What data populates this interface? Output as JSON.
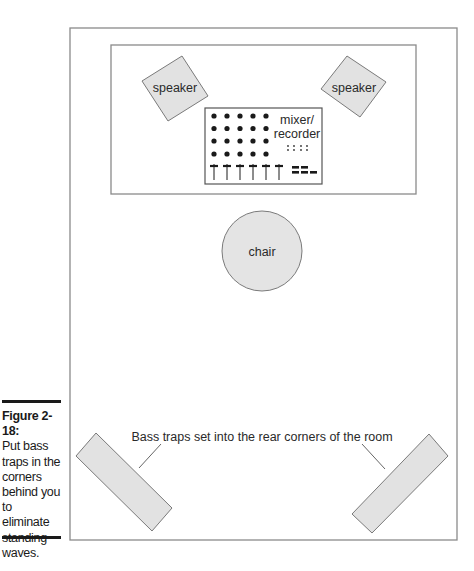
{
  "figure": {
    "number_label": "Figure 2-18:",
    "caption_lines": [
      "Put bass",
      "traps in the",
      "corners",
      "behind you",
      "to eliminate",
      "standing",
      "waves."
    ]
  },
  "diagram": {
    "speaker_left_label": "speaker",
    "speaker_right_label": "speaker",
    "mixer_label_line1": "mixer/",
    "mixer_label_line2": "recorder",
    "chair_label": "chair",
    "bass_trap_callout": "Bass traps set into the rear corners of the room"
  },
  "colors": {
    "outline": "#7a7a7a",
    "fill_gray": "#e4e4e4",
    "ink": "#1a1a1a"
  }
}
